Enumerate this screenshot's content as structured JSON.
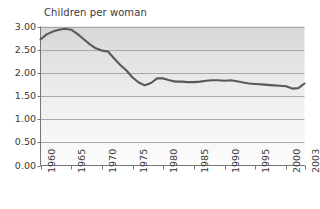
{
  "chart_data": {
    "type": "line",
    "title": "Children per woman",
    "xlabel": "",
    "ylabel": "",
    "xlim": [
      1960,
      2003
    ],
    "ylim": [
      0.0,
      3.0
    ],
    "grid": true,
    "legend": "none",
    "y_ticks": [
      "3.00",
      "2.50",
      "2.00",
      "1.50",
      "1.00",
      "0.50",
      "0.00"
    ],
    "y_tick_values": [
      3.0,
      2.5,
      2.0,
      1.5,
      1.0,
      0.5,
      0.0
    ],
    "x_ticks": [
      "1960",
      "1965",
      "1970",
      "1975",
      "1980",
      "1985",
      "1990",
      "1995",
      "2000",
      "2003"
    ],
    "x_tick_values": [
      1960,
      1965,
      1970,
      1975,
      1980,
      1985,
      1990,
      1995,
      2000,
      2003
    ],
    "series": [
      {
        "name": "Children per woman",
        "color": "#595959",
        "x": [
          1960,
          1961,
          1962,
          1963,
          1964,
          1965,
          1966,
          1967,
          1968,
          1969,
          1970,
          1971,
          1972,
          1973,
          1974,
          1975,
          1976,
          1977,
          1978,
          1979,
          1980,
          1981,
          1982,
          1983,
          1984,
          1985,
          1986,
          1987,
          1988,
          1989,
          1990,
          1991,
          1992,
          1993,
          1994,
          1995,
          1996,
          1997,
          1998,
          1999,
          2000,
          2001,
          2002,
          2003
        ],
        "values": [
          2.72,
          2.83,
          2.89,
          2.93,
          2.95,
          2.93,
          2.84,
          2.73,
          2.62,
          2.53,
          2.48,
          2.46,
          2.31,
          2.17,
          2.05,
          1.9,
          1.79,
          1.73,
          1.78,
          1.88,
          1.88,
          1.84,
          1.81,
          1.81,
          1.8,
          1.8,
          1.81,
          1.83,
          1.84,
          1.84,
          1.83,
          1.84,
          1.82,
          1.79,
          1.77,
          1.76,
          1.75,
          1.74,
          1.73,
          1.72,
          1.71,
          1.66,
          1.67,
          1.77
        ]
      }
    ],
    "colors": {
      "line": "#595959",
      "plot_background_top": "#d8d8d8",
      "plot_background_bottom": "#fbfbfb",
      "gridline": "#a8a8a8",
      "axis": "#777777",
      "text": "#3a3a3a"
    }
  }
}
